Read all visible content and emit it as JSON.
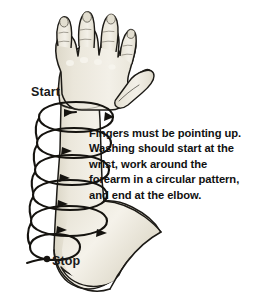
{
  "illustration": {
    "title": "handwashing-forearm-scrub-diagram",
    "colors": {
      "background": "#ffffff",
      "skin_fill": "#e9e5d9",
      "skin_fill_light": "#f2efe6",
      "skin_shadow": "#d8d3c4",
      "outline": "#1c1a16",
      "spiral_stroke": "#15130f",
      "text": "#111111"
    },
    "subject": "left arm, palm facing viewer, fingers pointing up",
    "spiral": {
      "description": "circular wrapping arrows from wrist down to elbow",
      "loop_count": 6,
      "direction": "clockwise-around-forearm",
      "start_point": "wrist",
      "end_point": "elbow"
    }
  },
  "labels": {
    "start": "Start",
    "stop": "Stop"
  },
  "instructions": {
    "lines": [
      "Fingers must be pointing up.",
      "Washing should start at the",
      "wrist, work around the",
      "forearm in a circular pattern,",
      "and end at the elbow."
    ],
    "line_1": "Fingers must be pointing up.",
    "line_2": "Washing should start at the",
    "line_3": "wrist, work around the",
    "line_4": "forearm in a circular pattern,",
    "line_5": "and end at the elbow."
  }
}
